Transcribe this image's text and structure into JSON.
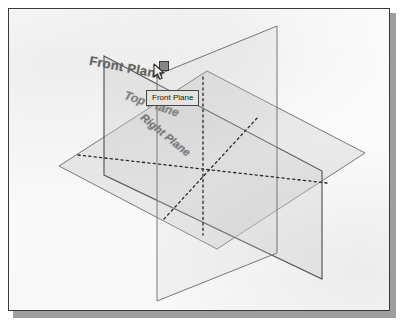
{
  "app": {
    "kind": "cad-viewport",
    "title": "3D reference planes view"
  },
  "scene": {
    "planes": [
      {
        "id": "front",
        "label": "Front Plane",
        "state": "highlighted",
        "orientation": "front"
      },
      {
        "id": "top",
        "label": "Top Plane",
        "state": "normal",
        "orientation": "top"
      },
      {
        "id": "right",
        "label": "Right Plane",
        "state": "normal",
        "orientation": "right"
      }
    ],
    "selection_handle": {
      "name": "plane-corner-handle",
      "shape": "square"
    },
    "tooltip": {
      "text": "Front Plane",
      "visible": true
    },
    "cursor": {
      "type": "arrow"
    }
  },
  "colors": {
    "plane_outline": "#7b7b7b",
    "plane_outline_dark": "#5d5d5d",
    "plane_fill": "#d9d9d9",
    "dashed_line": "#2a2a2a",
    "label_text": "#6f6f6f",
    "tooltip_bg": "#f1f1ea",
    "tooltip_border": "#4a4a4a",
    "handle_fill": "#8f8f8f",
    "handle_border": "#3c3c3c",
    "frame_border": "#3a3a3a",
    "page_background": "#ffffff",
    "shadow": "#9e9e9e"
  }
}
